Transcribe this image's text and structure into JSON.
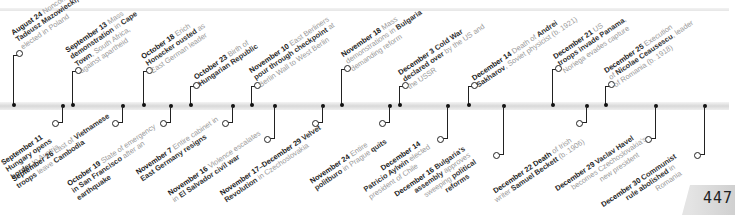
{
  "page": {
    "number": "447"
  },
  "timeline": {
    "above": [
      {
        "x": 13,
        "ringY": 52,
        "date": "August 24",
        "lines": [
          "Noncommunist leader,",
          "Tadeusz Mazowiecki,",
          "elected in Poland"
        ],
        "bold": [
          "",
          "Tadeusz Mazowiecki,",
          ""
        ]
      },
      {
        "x": 72,
        "ringY": 70,
        "date": "September 13",
        "lines": [
          "Mass",
          "demonstration in Cape",
          "Town, South Africa,",
          "against apartheid"
        ]
      },
      {
        "x": 143,
        "ringY": 70,
        "date": "October 18",
        "lines": [
          "Erich",
          "Honecker ousted as",
          "East German leader"
        ]
      },
      {
        "x": 190,
        "ringY": 85,
        "date": "October 23",
        "lines": [
          "Birth of",
          "Hungarian Republic"
        ]
      },
      {
        "x": 251,
        "ringY": 85,
        "date": "November 10",
        "lines": [
          "East Berliners",
          "pour through checkpoint at",
          "Berlin Wall to West Berlin"
        ]
      },
      {
        "x": 341,
        "ringY": 68,
        "date": "November 18",
        "lines": [
          "Mass",
          "demonstrations in Bulgaria",
          "demanding reform"
        ]
      },
      {
        "x": 399,
        "ringY": 85,
        "date": "December 3",
        "lines": [
          "Cold War",
          "declared over by the US and",
          "the USSR"
        ]
      },
      {
        "x": 468,
        "ringY": 85,
        "date": "December 14",
        "lines": [
          "Death of Andrei",
          "Sakharov, Soviet physicist (b. 1921)"
        ]
      },
      {
        "x": 552,
        "ringY": 68,
        "date": "December 21",
        "lines": [
          "US",
          "troops invade Panama,",
          "Noriega evades capture"
        ]
      },
      {
        "x": 611,
        "ringY": 84,
        "date": "December 25",
        "lines": [
          "Execution",
          "of Nicolae Ceausescu, leader",
          "of Romania (b. 1918)"
        ]
      }
    ],
    "below": [
      {
        "x": 61,
        "ringY": 122,
        "date": "September 11",
        "lines": [
          "Hungary opens",
          "border to Austria"
        ]
      },
      {
        "x": 122,
        "ringY": 122,
        "date": "September 26",
        "lines": [
          "Last of Vietnamese",
          "troops leave Cambodia"
        ]
      },
      {
        "x": 170,
        "ringY": 122,
        "date": "October 19",
        "lines": [
          "State of emergency",
          "in San Francisco after an",
          "earthquake"
        ]
      },
      {
        "x": 231,
        "ringY": 121,
        "date": "November 7",
        "lines": [
          "Entire cabinet in",
          "East Germany resigns"
        ]
      },
      {
        "x": 274,
        "ringY": 137,
        "date": "November 16",
        "lines": [
          "Violence escalates",
          "in El Salvador civil war"
        ]
      },
      {
        "x": 321,
        "ringY": 121,
        "date": "November 17–December 29",
        "lines": [
          "Velvet",
          "Revolution in Czechoslovakia"
        ]
      },
      {
        "x": 381,
        "ringY": 121,
        "date": "November 24",
        "lines": [
          "Entire",
          "politburo in Prague quits"
        ]
      },
      {
        "x": 443,
        "ringY": 137,
        "date": "December 14",
        "lines": [
          "Patricio Aylwin elected",
          "president of Chile"
        ]
      },
      {
        "x": 502,
        "ringY": 153,
        "date": "December 16",
        "lines": [
          "Bulgaria's",
          "assembly approves",
          "sweeping political",
          "reforms"
        ]
      },
      {
        "x": 588,
        "ringY": 121,
        "date": "December 22",
        "lines": [
          "Death of Irish",
          "writer Samuel Beckett (b. 1906)"
        ]
      },
      {
        "x": 653,
        "ringY": 136,
        "date": "December 29",
        "lines": [
          "Vaclav Havel",
          "becomes Czechoslovakia's",
          "new president"
        ]
      },
      {
        "x": 703,
        "ringY": 151,
        "date": "December 30",
        "lines": [
          "Communist",
          "rule abolished in",
          "Romania"
        ]
      }
    ]
  },
  "labels": {
    "a0": {
      "date": "August 24",
      "t1": " Noncommunist leader,",
      "t2": "Tadeusz Mazowiecki,",
      "t3": "elected in Poland"
    },
    "a1": {
      "date": "September 13",
      "t1": " Mass",
      "t2": "demonstration",
      "t2b": " in ",
      "t2c": "Cape",
      "t3": "Town",
      "t3b": ", South Africa,",
      "t4": "against apartheid"
    },
    "a2": {
      "date": "October 18",
      "t1": " Erich",
      "t2": "Honecker ousted",
      "t2b": " as",
      "t3": "East German leader"
    },
    "a3": {
      "date": "October 23",
      "t1": " Birth of",
      "t2": "Hungarian Republic"
    },
    "a4": {
      "date": "November 10",
      "t1": " East Berliners",
      "t2": "pour through checkpoint",
      "t2b": " at",
      "t3": "Berlin Wall to West Berlin"
    },
    "a5": {
      "date": "November 18",
      "t1": " Mass",
      "t2": "demonstrations",
      "t2b": " in ",
      "t2c": "Bulgaria",
      "t3": "demanding reform"
    },
    "a6": {
      "date": "December 3",
      "t1": " Cold War",
      "t2": "declared over",
      "t2b": " by the US and",
      "t3": "the USSR"
    },
    "a7": {
      "date": "December 14",
      "t1": " Death of ",
      "t1b": "Andrei",
      "t2": "Sakharov",
      "t2b": ", Soviet physicist (b. 1921)"
    },
    "a8": {
      "date": "December 21",
      "t1": " US",
      "t2": "troops invade Panama",
      "t2b": ",",
      "t3": "Noriega evades capture"
    },
    "a9": {
      "date": "December 25",
      "t1": " Execution",
      "t2": "of ",
      "t2b": "Nicolae Ceausescu",
      "t2c": ", leader",
      "t3": "of Romania (b. 1918)"
    },
    "b0": {
      "date": "September 11",
      "t1": "Hungary opens",
      "t2": "border",
      "t2b": " to Austria"
    },
    "b1": {
      "date": "September 26",
      "t1": " Last of ",
      "t1b": "Vietnamese",
      "t2": "troops",
      "t2b": " leave ",
      "t2c": "Cambodia"
    },
    "b2": {
      "date": "October 19",
      "t1": " State of emergency",
      "t2": "in San Francisco",
      "t2b": " after an",
      "t3": "earthquake"
    },
    "b3": {
      "date": "November 7",
      "t1": " Entire cabinet in",
      "t2": "East Germany resigns"
    },
    "b4": {
      "date": "November 16",
      "t1": " Violence escalates",
      "t2": "in ",
      "t2b": "El Salvador civil war"
    },
    "b5": {
      "date": "November 17–December 29",
      "t1": " Velvet",
      "t2": "Revolution",
      "t2b": " in Czechoslovakia"
    },
    "b6": {
      "date": "November 24",
      "t1": " Entire",
      "t2": "politburo",
      "t2b": " in Prague ",
      "t2c": "quits"
    },
    "b7": {
      "date": "December 14",
      "t1": "Patricio Aylwin",
      "t1b": " elected",
      "t2": "president of Chile"
    },
    "b8": {
      "date": "December 16",
      "t1": " Bulgaria's",
      "t2": "assembly",
      "t2b": " approves",
      "t3": "sweeping",
      "t3b": " political",
      "t4": "reforms"
    },
    "b9": {
      "date": "December 22",
      "t1": " Death",
      "t1b": " of Irish",
      "t2": "writer ",
      "t2b": "Samuel Beckett",
      "t2c": " (b. 1906)"
    },
    "b10": {
      "date": "December 29",
      "t1": " Vaclav Havel",
      "t2": "becomes Czechoslovakia's",
      "t3": "new president"
    },
    "b11": {
      "date": "December 30",
      "t1": " Communist",
      "t2": "rule abolished",
      "t2b": " in",
      "t3": "Romania"
    }
  }
}
